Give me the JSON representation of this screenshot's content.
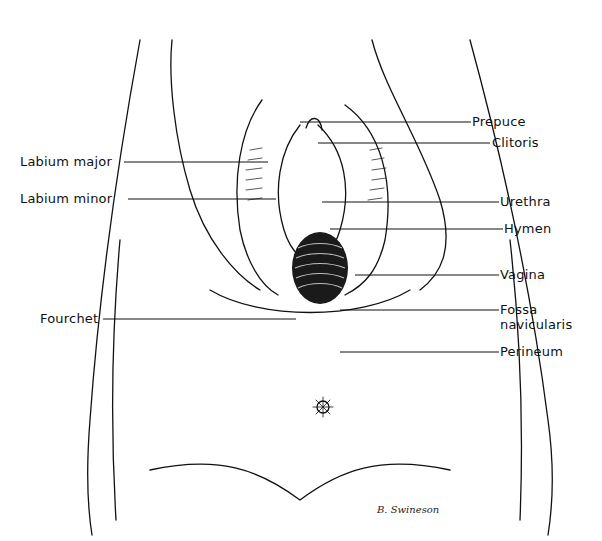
{
  "figure": {
    "signature": "B. Swineson",
    "labels_left": [
      {
        "text": "Labium major",
        "x": 20,
        "y": 155,
        "line_to": 268
      },
      {
        "text": "Labium minor",
        "x": 20,
        "y": 192,
        "line_to": 276
      },
      {
        "text": "Fourchet",
        "x": 40,
        "y": 312,
        "line_to": 296
      }
    ],
    "labels_right": [
      {
        "text": "Prepuce",
        "x": 472,
        "y": 112,
        "line_from": 300
      },
      {
        "text": "Clitoris",
        "x": 492,
        "y": 136,
        "line_from": 318
      },
      {
        "text": "Urethra",
        "x": 500,
        "y": 195,
        "line_from": 322
      },
      {
        "text": "Hymen",
        "x": 504,
        "y": 222,
        "line_from": 330
      },
      {
        "text": "Vagina",
        "x": 500,
        "y": 268,
        "line_from": 355
      },
      {
        "text": "Fossa",
        "x": 500,
        "y": 303,
        "line_from": 340
      },
      {
        "text": "navicularis",
        "x": 500,
        "y": 318,
        "line_from": null
      },
      {
        "text": "Perineum",
        "x": 500,
        "y": 345,
        "line_from": 340
      }
    ]
  }
}
